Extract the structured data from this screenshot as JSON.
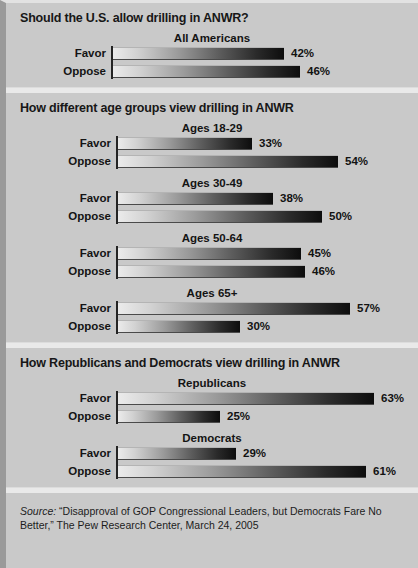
{
  "colors": {
    "background": "#c9c9c9",
    "divider": "#e9e9e9",
    "axis": "#242424",
    "bar_light": "#ebebeb",
    "bar_dark": "#0d0d0d",
    "text": "#141414"
  },
  "sections": [
    {
      "id": "all-americans",
      "title": "Should the U.S. allow drilling in ANWR?",
      "axis_left": 105,
      "label_left": 30,
      "label_width": 70,
      "groups": [
        {
          "name": "All Americans",
          "rows": [
            {
              "label": "Favor",
              "value": 42,
              "value_label": "42%"
            },
            {
              "label": "Oppose",
              "value": 46,
              "value_label": "46%"
            }
          ]
        }
      ]
    },
    {
      "id": "age-groups",
      "title": "How different age groups view drilling in ANWR",
      "axis_left": 110,
      "label_left": 35,
      "label_width": 70,
      "groups": [
        {
          "name": "Ages 18-29",
          "rows": [
            {
              "label": "Favor",
              "value": 33,
              "value_label": "33%"
            },
            {
              "label": "Oppose",
              "value": 54,
              "value_label": "54%"
            }
          ]
        },
        {
          "name": "Ages 30-49",
          "rows": [
            {
              "label": "Favor",
              "value": 38,
              "value_label": "38%"
            },
            {
              "label": "Oppose",
              "value": 50,
              "value_label": "50%"
            }
          ]
        },
        {
          "name": "Ages 50-64",
          "rows": [
            {
              "label": "Favor",
              "value": 45,
              "value_label": "45%"
            },
            {
              "label": "Oppose",
              "value": 46,
              "value_label": "46%"
            }
          ]
        },
        {
          "name": "Ages 65+",
          "rows": [
            {
              "label": "Favor",
              "value": 57,
              "value_label": "57%"
            },
            {
              "label": "Oppose",
              "value": 30,
              "value_label": "30%"
            }
          ]
        }
      ]
    },
    {
      "id": "party",
      "title": "How Republicans and Democrats view drilling in ANWR",
      "axis_left": 110,
      "label_left": 35,
      "label_width": 70,
      "groups": [
        {
          "name": "Republicans",
          "rows": [
            {
              "label": "Favor",
              "value": 63,
              "value_label": "63%"
            },
            {
              "label": "Oppose",
              "value": 25,
              "value_label": "25%"
            }
          ]
        },
        {
          "name": "Democrats",
          "rows": [
            {
              "label": "Favor",
              "value": 29,
              "value_label": "29%"
            },
            {
              "label": "Oppose",
              "value": 61,
              "value_label": "61%"
            }
          ]
        }
      ]
    }
  ],
  "source": {
    "prefix": "Source:",
    "text": " “Disapproval of GOP Congressional Leaders, but Democrats Fare No Better,” The Pew Research Center, March 24, 2005"
  },
  "chart_data": {
    "type": "bar",
    "title": "Should the U.S. allow drilling in ANWR?",
    "orientation": "horizontal",
    "xlabel": "",
    "ylabel": "",
    "xlim": [
      0,
      70
    ],
    "grid": false,
    "legend": "none",
    "units": "percent",
    "panels": [
      {
        "panel_title": "Should the U.S. allow drilling in ANWR?",
        "groups": [
          {
            "name": "All Americans",
            "categories": [
              "Favor",
              "Oppose"
            ],
            "values": [
              42,
              46
            ]
          }
        ]
      },
      {
        "panel_title": "How different age groups view drilling in ANWR",
        "groups": [
          {
            "name": "Ages 18-29",
            "categories": [
              "Favor",
              "Oppose"
            ],
            "values": [
              33,
              54
            ]
          },
          {
            "name": "Ages 30-49",
            "categories": [
              "Favor",
              "Oppose"
            ],
            "values": [
              38,
              50
            ]
          },
          {
            "name": "Ages 50-64",
            "categories": [
              "Favor",
              "Oppose"
            ],
            "values": [
              45,
              46
            ]
          },
          {
            "name": "Ages 65+",
            "categories": [
              "Favor",
              "Oppose"
            ],
            "values": [
              57,
              30
            ]
          }
        ]
      },
      {
        "panel_title": "How Republicans and Democrats view drilling in ANWR",
        "groups": [
          {
            "name": "Republicans",
            "categories": [
              "Favor",
              "Oppose"
            ],
            "values": [
              63,
              25
            ]
          },
          {
            "name": "Democrats",
            "categories": [
              "Favor",
              "Oppose"
            ],
            "values": [
              29,
              61
            ]
          }
        ]
      }
    ],
    "annotation": "Source: “Disapproval of GOP Congressional Leaders, but Democrats Fare No Better,” The Pew Research Center, March 24, 2005"
  }
}
